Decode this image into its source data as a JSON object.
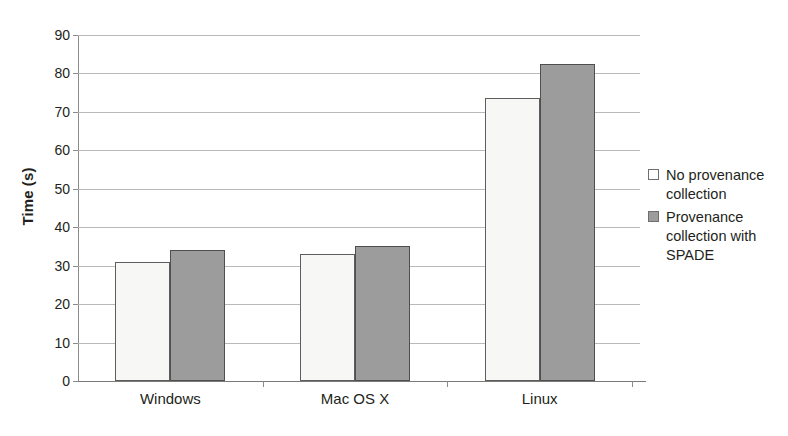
{
  "chart_data": {
    "type": "bar",
    "title": "",
    "xlabel": "",
    "ylabel": "Time (s)",
    "categories": [
      "Windows",
      "Mac OS X",
      "Linux"
    ],
    "series": [
      {
        "name": "No provenance collection",
        "color": "#f7f7f6",
        "values": [
          31,
          33,
          73.5
        ]
      },
      {
        "name": "Provenance collection with SPADE",
        "color": "#9c9c9c",
        "values": [
          34,
          35,
          82.5
        ]
      }
    ],
    "ylim": [
      0,
      90
    ],
    "ytick_step": 10,
    "yticks": [
      0,
      10,
      20,
      30,
      40,
      50,
      60,
      70,
      80,
      90
    ],
    "ytick_labels": [
      "0",
      "10",
      "20",
      "30",
      "40",
      "50",
      "60",
      "70",
      "80",
      "90"
    ],
    "grid": true,
    "grid_axis": "y",
    "legend_position": "right"
  },
  "legend": {
    "entries": [
      {
        "label": "No provenance collection",
        "swatch": "light"
      },
      {
        "label": "Provenance collection with SPADE",
        "swatch": "dark"
      }
    ]
  }
}
